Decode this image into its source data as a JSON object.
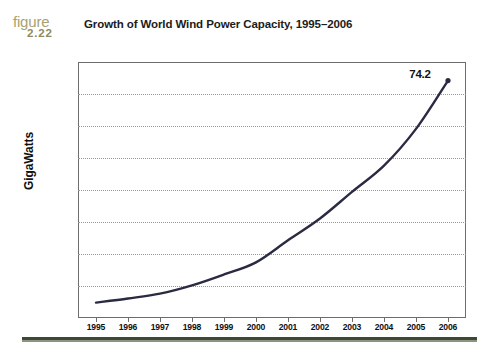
{
  "figure": {
    "word": "figure",
    "number": "2.22",
    "color": "#a6a273"
  },
  "title": "Growth of World Wind Power Capacity, 1995–2006",
  "rule_color": "#3c4a35",
  "chart_data": {
    "type": "line",
    "title": "Growth of World Wind Power Capacity, 1995–2006",
    "xlabel": "",
    "ylabel": "GigaWatts",
    "categories": [
      "1995",
      "1996",
      "1997",
      "1998",
      "1999",
      "2000",
      "2001",
      "2002",
      "2003",
      "2004",
      "2005",
      "2006"
    ],
    "values": [
      4.8,
      6.1,
      7.6,
      10.2,
      13.6,
      17.4,
      24.3,
      31.1,
      39.4,
      47.6,
      59.1,
      74.2
    ],
    "ylim": [
      0,
      80
    ],
    "ytick_labels": [
      "0",
      "10",
      "20",
      "30",
      "40",
      "50",
      "60",
      "70",
      "80"
    ],
    "ytick_values": [
      0,
      10,
      20,
      30,
      40,
      50,
      60,
      70,
      80
    ],
    "grid": true,
    "grid_style": "dotted-horizontal",
    "legend": "none",
    "line_color": "#2a2a42",
    "annotations": [
      {
        "text": "74.2",
        "x_category": "2006",
        "y_value": 74.2
      }
    ]
  }
}
